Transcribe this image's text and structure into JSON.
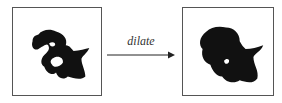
{
  "diagram": {
    "operation_label": "dilate",
    "input_panel": {
      "description": "binary blob shape with holes"
    },
    "output_panel": {
      "description": "dilated binary blob shape"
    },
    "colors": {
      "shape": "#111111",
      "border": "#555555",
      "arrow": "#222222"
    }
  }
}
